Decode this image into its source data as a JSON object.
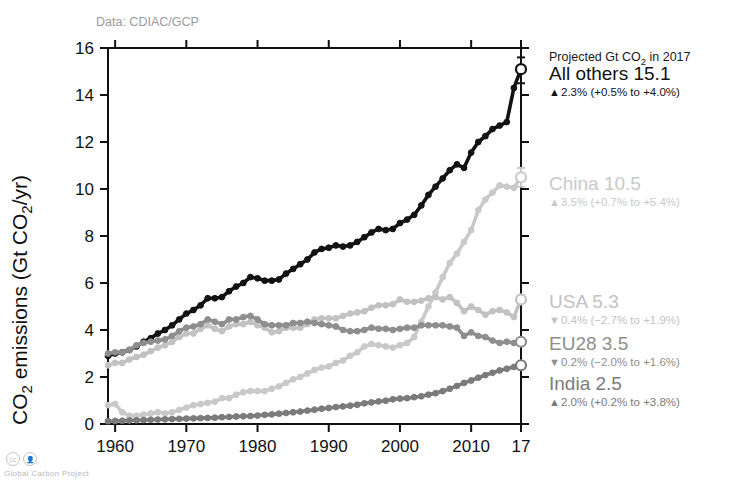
{
  "figure": {
    "source_note": "Data: CDIAC/GCP",
    "credit": "Global Carbon Project",
    "legend_header": "Projected Gt CO",
    "legend_header_sub": "2",
    "legend_header_tail": " in 2017"
  },
  "chart_data": {
    "type": "line",
    "title": "",
    "xlabel": "",
    "ylabel": "CO2 emissions (Gt CO2/yr)",
    "ylabel_parts": [
      "CO",
      "2",
      " emissions (Gt CO",
      "2",
      "/yr)"
    ],
    "xlim": [
      1959,
      2017
    ],
    "ylim": [
      0,
      16
    ],
    "yticks": [
      0,
      2,
      4,
      6,
      8,
      10,
      12,
      14,
      16
    ],
    "xticks": [
      1960,
      1970,
      1980,
      1990,
      2000,
      2010,
      2017
    ],
    "xtick_labels": [
      "1960",
      "1970",
      "1980",
      "1990",
      "2000",
      "2010",
      "17"
    ],
    "grid": false,
    "legend_position": "right",
    "x": [
      1959,
      1960,
      1961,
      1962,
      1963,
      1964,
      1965,
      1966,
      1967,
      1968,
      1969,
      1970,
      1971,
      1972,
      1973,
      1974,
      1975,
      1976,
      1977,
      1978,
      1979,
      1980,
      1981,
      1982,
      1983,
      1984,
      1985,
      1986,
      1987,
      1988,
      1989,
      1990,
      1991,
      1992,
      1993,
      1994,
      1995,
      1996,
      1997,
      1998,
      1999,
      2000,
      2001,
      2002,
      2003,
      2004,
      2005,
      2006,
      2007,
      2008,
      2009,
      2010,
      2011,
      2012,
      2013,
      2014,
      2015,
      2016
    ],
    "series": [
      {
        "name": "All others",
        "color": "#121212",
        "projected_2017": 15.1,
        "projected_label": "All others 15.1",
        "trend_dir": "up",
        "trend_text": "2.3% (+0.5% to +4.0%)",
        "ci_low": 14.5,
        "ci_high": 15.6,
        "values": [
          2.9,
          3.0,
          3.05,
          3.15,
          3.3,
          3.5,
          3.65,
          3.85,
          4.0,
          4.2,
          4.45,
          4.7,
          4.85,
          5.05,
          5.35,
          5.35,
          5.4,
          5.65,
          5.85,
          6.0,
          6.25,
          6.2,
          6.1,
          6.1,
          6.15,
          6.4,
          6.6,
          6.8,
          7.0,
          7.3,
          7.45,
          7.5,
          7.6,
          7.55,
          7.6,
          7.75,
          7.95,
          8.15,
          8.3,
          8.25,
          8.3,
          8.55,
          8.7,
          8.9,
          9.3,
          9.75,
          10.1,
          10.45,
          10.8,
          11.05,
          10.9,
          11.55,
          12.0,
          12.25,
          12.55,
          12.7,
          12.85,
          14.3
        ]
      },
      {
        "name": "China",
        "color": "#c9c9c9",
        "projected_2017": 10.5,
        "projected_label": "China 10.5",
        "trend_dir": "up",
        "trend_text": "3.5% (+0.7% to +5.4%)",
        "ci_low": 10.1,
        "ci_high": 10.9,
        "values": [
          0.8,
          0.85,
          0.5,
          0.35,
          0.35,
          0.4,
          0.45,
          0.5,
          0.45,
          0.5,
          0.6,
          0.7,
          0.8,
          0.85,
          0.9,
          0.95,
          1.1,
          1.1,
          1.25,
          1.35,
          1.4,
          1.4,
          1.4,
          1.5,
          1.6,
          1.75,
          1.9,
          2.0,
          2.15,
          2.3,
          2.4,
          2.45,
          2.6,
          2.7,
          2.9,
          3.05,
          3.3,
          3.4,
          3.35,
          3.3,
          3.25,
          3.35,
          3.45,
          3.7,
          4.35,
          5.0,
          5.6,
          6.25,
          6.85,
          7.25,
          7.75,
          8.25,
          9.1,
          9.55,
          9.85,
          10.15,
          10.1,
          10.05
        ]
      },
      {
        "name": "USA",
        "color": "#c2c2c2",
        "projected_2017": 5.3,
        "projected_label": "USA 5.3",
        "trend_dir": "down",
        "trend_text": "0.4% (−2.7% to +1.9%)",
        "ci_low": 5.15,
        "ci_high": 5.45,
        "values": [
          2.5,
          2.6,
          2.6,
          2.75,
          2.85,
          2.95,
          3.1,
          3.25,
          3.35,
          3.5,
          3.7,
          3.85,
          3.85,
          4.05,
          4.2,
          4.05,
          3.95,
          4.15,
          4.25,
          4.25,
          4.35,
          4.2,
          4.1,
          3.9,
          3.95,
          4.1,
          4.1,
          4.1,
          4.25,
          4.45,
          4.5,
          4.5,
          4.5,
          4.6,
          4.7,
          4.75,
          4.8,
          4.95,
          5.05,
          5.05,
          5.1,
          5.3,
          5.2,
          5.2,
          5.25,
          5.35,
          5.4,
          5.3,
          5.4,
          5.15,
          4.8,
          5.0,
          4.85,
          4.65,
          4.8,
          4.85,
          4.75,
          4.55
        ]
      },
      {
        "name": "EU28",
        "color": "#8e8e8e",
        "projected_2017": 3.5,
        "projected_label": "EU28 3.5",
        "trend_dir": "down",
        "trend_text": "0.2% (−2.0% to +1.6%)",
        "ci_low": 3.4,
        "ci_high": 3.6,
        "values": [
          3.0,
          3.05,
          3.05,
          3.15,
          3.35,
          3.45,
          3.5,
          3.55,
          3.6,
          3.75,
          3.95,
          4.1,
          4.15,
          4.25,
          4.45,
          4.35,
          4.25,
          4.45,
          4.45,
          4.55,
          4.6,
          4.45,
          4.25,
          4.2,
          4.2,
          4.2,
          4.3,
          4.3,
          4.35,
          4.3,
          4.25,
          4.2,
          4.15,
          4.0,
          3.95,
          3.95,
          4.0,
          4.1,
          4.05,
          4.05,
          4.0,
          4.05,
          4.1,
          4.1,
          4.2,
          4.2,
          4.2,
          4.2,
          4.15,
          4.1,
          3.75,
          3.9,
          3.75,
          3.7,
          3.55,
          3.45,
          3.5,
          3.45
        ]
      },
      {
        "name": "India",
        "color": "#7b7b7b",
        "projected_2017": 2.5,
        "projected_label": "India 2.5",
        "trend_dir": "up",
        "trend_text": "2.0% (+0.2% to +3.8%)",
        "ci_low": 2.45,
        "ci_high": 2.6,
        "values": [
          0.12,
          0.13,
          0.14,
          0.15,
          0.16,
          0.17,
          0.18,
          0.19,
          0.2,
          0.21,
          0.22,
          0.23,
          0.24,
          0.25,
          0.26,
          0.27,
          0.29,
          0.3,
          0.32,
          0.33,
          0.34,
          0.36,
          0.39,
          0.41,
          0.44,
          0.47,
          0.5,
          0.53,
          0.57,
          0.61,
          0.65,
          0.68,
          0.72,
          0.75,
          0.78,
          0.82,
          0.88,
          0.92,
          0.96,
          0.99,
          1.05,
          1.08,
          1.1,
          1.14,
          1.18,
          1.25,
          1.31,
          1.4,
          1.5,
          1.62,
          1.75,
          1.85,
          1.97,
          2.08,
          2.18,
          2.28,
          2.35,
          2.43
        ]
      }
    ]
  }
}
